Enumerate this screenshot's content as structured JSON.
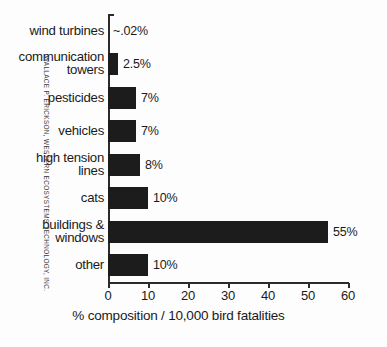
{
  "chart_data": {
    "type": "bar",
    "orientation": "horizontal",
    "title": "",
    "xlabel": "% composition / 10,000 bird fatalities",
    "ylabel": "",
    "xlim": [
      0,
      60
    ],
    "xticks": [
      0,
      10,
      20,
      30,
      40,
      50,
      60
    ],
    "xtick_labels": [
      "0",
      "10",
      "20",
      "30",
      "40",
      "50",
      "60"
    ],
    "grid": false,
    "legend": null,
    "categories": [
      "wind turbines",
      "communication towers",
      "pesticides",
      "vehicles",
      "high tension lines",
      "cats",
      "buildings & windows",
      "other"
    ],
    "category_lines": [
      [
        "wind turbines"
      ],
      [
        "communication",
        "towers"
      ],
      [
        "pesticides"
      ],
      [
        "vehicles"
      ],
      [
        "high tension",
        "lines"
      ],
      [
        "cats"
      ],
      [
        "buildings &",
        "windows"
      ],
      [
        "other"
      ]
    ],
    "values": [
      0.02,
      2.5,
      7,
      7,
      8,
      10,
      55,
      10
    ],
    "value_labels": [
      "~.02%",
      "2.5%",
      "7%",
      "7%",
      "8%",
      "10%",
      "55%",
      "10%"
    ],
    "bar_color": "#1c1c1c",
    "axis_color": "#2b2b2b",
    "background_color": "#fdfdfd"
  },
  "credit": {
    "text": "WALLACE P. ERICKSON, WESTERN ECOSYSTEMS TECHNOLOGY, INC."
  }
}
